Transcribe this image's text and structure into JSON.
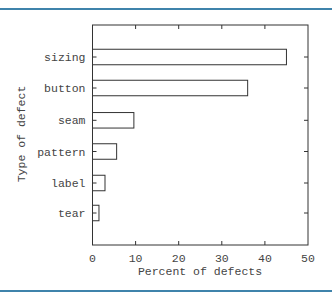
{
  "colors": {
    "rule": "#3f83ab",
    "axis": "#333333",
    "bar_fill": "#ffffff",
    "bar_stroke": "#333333"
  },
  "chart_data": {
    "type": "bar",
    "orientation": "horizontal",
    "title": "",
    "xlabel": "Percent of defects",
    "ylabel": "Type of defect",
    "categories": [
      "sizing",
      "button",
      "seam",
      "pattern",
      "label",
      "tear"
    ],
    "values": [
      45,
      36,
      9.6,
      5.6,
      2.9,
      1.5
    ],
    "xlim": [
      0,
      50
    ],
    "xticks": [
      0,
      10,
      20,
      30,
      40,
      50
    ],
    "grid": false,
    "legend": null
  }
}
